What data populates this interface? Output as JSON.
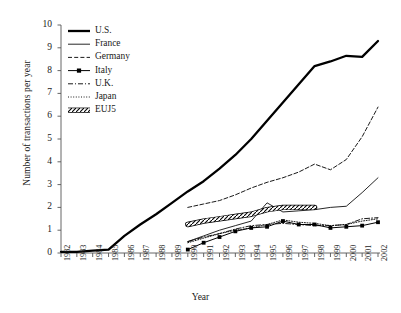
{
  "chart_data": {
    "type": "line",
    "title": "",
    "xlabel": "Year",
    "ylabel": "Number of transactions per year",
    "xlim": [
      1982,
      2002
    ],
    "ylim": [
      0,
      10
    ],
    "grid": false,
    "legend_position": "top-left",
    "x": [
      1982,
      1983,
      1984,
      1985,
      1986,
      1987,
      1988,
      1989,
      1990,
      1991,
      1992,
      1993,
      1994,
      1995,
      1996,
      1997,
      1998,
      1999,
      2000,
      2001,
      2002
    ],
    "xtick_labels": [
      "1982",
      "1983",
      "1984",
      "1985",
      "1986",
      "1987",
      "1988",
      "1989",
      "1990",
      "1991",
      "1992",
      "1993",
      "1994",
      "1995",
      "1996",
      "1997",
      "1998",
      "1999",
      "2000",
      "2001",
      "2002"
    ],
    "ytick_labels": [
      "0",
      "1",
      "2",
      "3",
      "4",
      "5",
      "6",
      "7",
      "8",
      "9",
      "10"
    ],
    "ytick_values": [
      0,
      1,
      2,
      3,
      4,
      5,
      6,
      7,
      8,
      9,
      10
    ],
    "series": [
      {
        "name": "U.S.",
        "style": "solid-thick",
        "color": "#000000",
        "x": [
          1982,
          1983,
          1984,
          1985,
          1986,
          1987,
          1988,
          1989,
          1990,
          1991,
          1992,
          1993,
          1994,
          1995,
          1996,
          1997,
          1998,
          1999,
          2000,
          2001,
          2002
        ],
        "values": [
          0.05,
          0.05,
          0.1,
          0.15,
          0.75,
          1.25,
          1.7,
          2.2,
          2.7,
          3.15,
          3.7,
          4.3,
          5.0,
          5.8,
          6.6,
          7.4,
          8.2,
          8.4,
          8.65,
          8.6,
          9.3
        ]
      },
      {
        "name": "France",
        "style": "solid-thin",
        "color": "#000000",
        "x": [
          1990,
          1991,
          1992,
          1993,
          1994,
          1995,
          1996,
          1997,
          1998,
          1999,
          2000,
          2001,
          2002
        ],
        "values": [
          0.5,
          0.75,
          1.0,
          1.2,
          1.4,
          2.2,
          1.8,
          1.85,
          1.9,
          2.0,
          2.05,
          2.65,
          3.3
        ]
      },
      {
        "name": "Germany",
        "style": "dashed",
        "color": "#000000",
        "x": [
          1990,
          1991,
          1992,
          1993,
          1994,
          1995,
          1996,
          1997,
          1998,
          1999,
          2000,
          2001,
          2002
        ],
        "values": [
          2.0,
          2.15,
          2.3,
          2.55,
          2.85,
          3.1,
          3.3,
          3.55,
          3.9,
          3.65,
          4.1,
          5.1,
          6.4
        ]
      },
      {
        "name": "Italy",
        "style": "solid-marker",
        "color": "#000000",
        "x": [
          1990,
          1991,
          1992,
          1993,
          1994,
          1995,
          1996,
          1997,
          1998,
          1999,
          2000,
          2001,
          2002
        ],
        "values": [
          0.15,
          0.45,
          0.7,
          0.95,
          1.1,
          1.15,
          1.4,
          1.25,
          1.25,
          1.1,
          1.15,
          1.2,
          1.35
        ]
      },
      {
        "name": "U.K.",
        "style": "dash-dot",
        "color": "#000000",
        "x": [
          1990,
          1991,
          1992,
          1993,
          1994,
          1995,
          1996,
          1997,
          1998,
          1999,
          2000,
          2001,
          2002
        ],
        "values": [
          0.5,
          0.7,
          0.85,
          1.05,
          1.2,
          1.25,
          1.3,
          1.25,
          1.2,
          1.2,
          1.25,
          1.5,
          1.55
        ]
      },
      {
        "name": "Japan",
        "style": "dotted",
        "color": "#000000",
        "x": [
          1990,
          1991,
          1992,
          1993,
          1994,
          1995,
          1996,
          1997,
          1998,
          1999,
          2000,
          2001,
          2002
        ],
        "values": [
          0.45,
          0.65,
          0.85,
          1.0,
          1.1,
          1.25,
          1.45,
          1.35,
          1.3,
          1.2,
          1.25,
          1.4,
          1.5
        ]
      },
      {
        "name": "EUJ5",
        "style": "hatched-band",
        "color": "#000000",
        "x": [
          1990,
          1991,
          1992,
          1993,
          1994,
          1995,
          1996,
          1997,
          1998
        ],
        "values": [
          1.25,
          1.4,
          1.5,
          1.6,
          1.7,
          1.9,
          2.0,
          2.0,
          2.0
        ]
      }
    ],
    "legend": [
      {
        "label": "U.S.",
        "style": "solid-thick"
      },
      {
        "label": "France",
        "style": "solid-thin"
      },
      {
        "label": "Germany",
        "style": "dashed"
      },
      {
        "label": "Italy",
        "style": "solid-marker"
      },
      {
        "label": "U.K.",
        "style": "dash-dot"
      },
      {
        "label": "Japan",
        "style": "dotted"
      },
      {
        "label": "EUJ5",
        "style": "hatched-band"
      }
    ]
  }
}
